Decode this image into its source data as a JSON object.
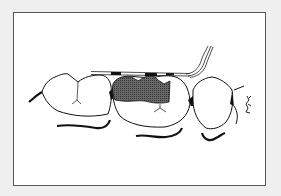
{
  "illustration": {
    "subject": "dental line drawing of posterior teeth with periodontal probe across shaded interproximal restoration",
    "colors": {
      "background": "#efefef",
      "frame_fill": "#ffffff",
      "frame_border": "#555555",
      "line": "#111111",
      "restoration_fill": "#555555"
    },
    "elements": [
      {
        "name": "tooth-left"
      },
      {
        "name": "tooth-middle-with-restoration"
      },
      {
        "name": "tooth-right"
      },
      {
        "name": "periodontal-probe"
      },
      {
        "name": "gingival-lines"
      },
      {
        "name": "small-figure-mark"
      }
    ]
  }
}
